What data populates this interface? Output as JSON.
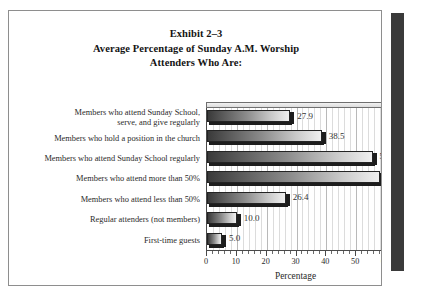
{
  "figure": {
    "title_lines": [
      "Exhibit 2–3",
      "Average Percentage of Sunday A.M. Worship",
      "Attenders Who Are:"
    ]
  },
  "chart_data": {
    "type": "bar",
    "orientation": "horizontal",
    "title": "Exhibit 2–3 Average Percentage of Sunday A.M. Worship Attenders Who Are:",
    "xlabel": "Percentage",
    "ylabel": "",
    "xlim": [
      0,
      60
    ],
    "xticks": [
      0,
      10,
      20,
      30,
      40,
      50,
      60
    ],
    "xtick_labels": [
      "0",
      "10",
      "20",
      "30",
      "40",
      "50",
      "60"
    ],
    "minor_tick_step": 2,
    "grid": true,
    "legend": false,
    "categories": [
      "Members who attend Sunday School,\nserve, and give regularly",
      "Members who hold a position in the church",
      "Members who attend Sunday School regularly",
      "Members who attend more than 50%",
      "Members who attend less than 50%",
      "Regular attenders (not members)",
      "First-time guests"
    ],
    "values": [
      27.9,
      38.5,
      55.5,
      58.0,
      26.4,
      10.0,
      5.0
    ],
    "value_labels": [
      "27.9",
      "38.5",
      "55.5",
      "58.0",
      "26.4",
      "10.0",
      "5.0"
    ],
    "bar_color_start": "#3a3a3a",
    "bar_color_end": "#efefef",
    "bar_edge_color": "#242424"
  }
}
